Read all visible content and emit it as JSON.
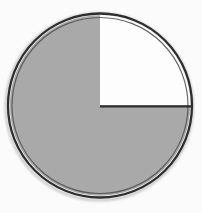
{
  "figure": {
    "background_color": "#fbfbfb"
  },
  "chart_data": {
    "type": "pie",
    "title": "",
    "xlabel": "",
    "ylabel": "",
    "legend": "none",
    "labels_shown": false,
    "start_angle_deg": -90,
    "direction": "clockwise",
    "slices": [
      {
        "label": "unshaded",
        "fraction": 0.25,
        "color": "#fdfdfd"
      },
      {
        "label": "shaded",
        "fraction": 0.75,
        "color": "#a9a9a9"
      }
    ],
    "rim_color": "#2e2e2e",
    "inner_outline_color": "#4f4f4f",
    "divider_line_color": "#2b2b2b",
    "shadow_color": "#c9c9c9",
    "divider_lines": [
      "radius-to-3-oclock"
    ]
  }
}
